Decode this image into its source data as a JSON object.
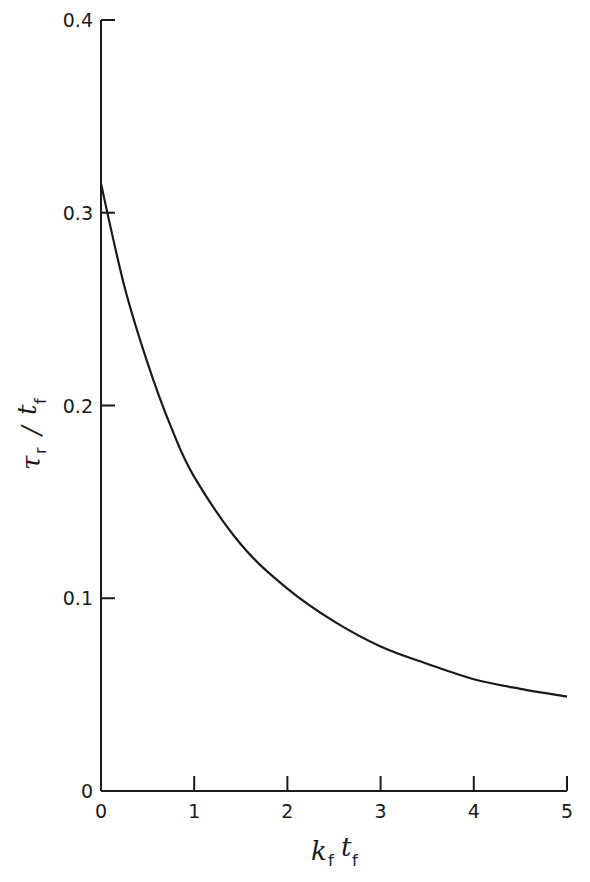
{
  "chart_data": {
    "type": "line",
    "title": "",
    "xlabel": "k_f t_f",
    "ylabel": "τ_r / t_f",
    "xlim": [
      0,
      5
    ],
    "ylim": [
      0,
      0.4
    ],
    "grid": false,
    "legend": null,
    "x_ticks": [
      "0",
      "1",
      "2",
      "3",
      "4",
      "5"
    ],
    "y_ticks": [
      "0",
      "0.1",
      "0.2",
      "0.3",
      "0.4"
    ],
    "series": [
      {
        "name": "τr/tf",
        "x": [
          0,
          0.25,
          0.5,
          0.75,
          1,
          1.5,
          2,
          2.5,
          3,
          3.5,
          4,
          4.5,
          5
        ],
        "values": [
          0.315,
          0.262,
          0.222,
          0.189,
          0.163,
          0.128,
          0.105,
          0.088,
          0.075,
          0.066,
          0.058,
          0.053,
          0.049
        ]
      }
    ]
  },
  "axes": {
    "x_label_main": "k",
    "x_label_sub1": "f",
    "x_label_main2": "t",
    "x_label_sub2": "f",
    "y_label_main": "τ",
    "y_label_sub1": "r",
    "y_label_slash": "/",
    "y_label_main2": "t",
    "y_label_sub2": "f"
  }
}
